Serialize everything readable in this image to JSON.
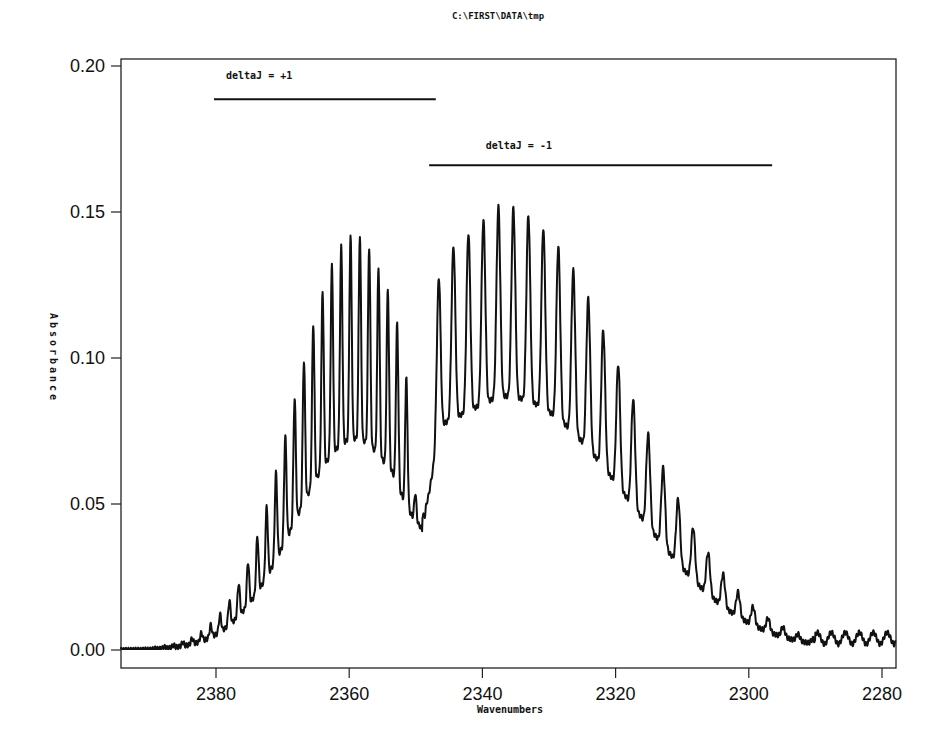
{
  "title": "C:\\FIRST\\DATA\\tmp",
  "chart_data": {
    "type": "line",
    "title": "C:\\FIRST\\DATA\\tmp",
    "xlabel": "Wavenumbers",
    "ylabel": "Absorbance",
    "xlim": [
      2394.3,
      2277.9
    ],
    "x_reversed": true,
    "ylim": [
      -0.006,
      0.202
    ],
    "x_ticks": [
      2380,
      2360,
      2340,
      2320,
      2300,
      2280
    ],
    "x_tick_labels": [
      "2380",
      "2360",
      "2340",
      "2320",
      "2300",
      "2280"
    ],
    "y_ticks": [
      0.0,
      0.05,
      0.1,
      0.15,
      0.2
    ],
    "y_tick_labels": [
      "0.00",
      "0.05",
      "0.10",
      "0.15",
      "0.20"
    ],
    "grid": false,
    "legend": null,
    "annotations": [
      {
        "text": "deltaJ = +1",
        "line_x": [
          2380.3,
          2347.0
        ],
        "line_y": 0.1886,
        "text_x": 2378.5,
        "text_y": 0.1955
      },
      {
        "text": "deltaJ = -1",
        "line_x": [
          2348.0,
          2296.5
        ],
        "line_y": 0.166,
        "text_x": 2339.5,
        "text_y": 0.1715
      }
    ],
    "series": [
      {
        "name": "Absorbance spectrum",
        "color": "#111111",
        "description": "Rotational-vibrational band with R branch (deltaJ=+1, ~2394-2349 cm-1) and P branch (deltaJ=-1, ~2349-2278 cm-1); band gap near 2349 cm-1",
        "r_branch_peaks": {
          "x": [
            2385.0,
            2383.6,
            2382.2,
            2380.8,
            2379.4,
            2378.0,
            2376.6,
            2375.2,
            2373.8,
            2372.4,
            2371.0,
            2369.6,
            2368.2,
            2366.8,
            2365.4,
            2364.0,
            2362.6,
            2361.2,
            2359.8,
            2358.4,
            2357.0,
            2355.6,
            2354.2,
            2352.8,
            2351.4
          ],
          "y": [
            0.006,
            0.009,
            0.013,
            0.019,
            0.026,
            0.034,
            0.043,
            0.054,
            0.066,
            0.079,
            0.093,
            0.107,
            0.121,
            0.134,
            0.147,
            0.159,
            0.168,
            0.176,
            0.181,
            0.189,
            0.183,
            0.178,
            0.168,
            0.15,
            0.108
          ]
        },
        "p_branch_peaks": {
          "x": [
            2346.6,
            2344.3,
            2342.1,
            2339.8,
            2337.6,
            2335.3,
            2333.1,
            2330.8,
            2328.6,
            2326.3,
            2324.1,
            2321.8,
            2319.6,
            2317.3,
            2315.1,
            2312.8,
            2310.6,
            2308.3,
            2306.1,
            2303.8,
            2301.6,
            2299.3,
            2297.1,
            2294.8,
            2292.6,
            2290.3,
            2288.1,
            2285.8
          ],
          "y": [
            0.079,
            0.146,
            0.15,
            0.152,
            0.154,
            0.15,
            0.149,
            0.146,
            0.143,
            0.142,
            0.13,
            0.125,
            0.119,
            0.112,
            0.101,
            0.088,
            0.073,
            0.06,
            0.051,
            0.041,
            0.031,
            0.024,
            0.018,
            0.014,
            0.011,
            0.009,
            0.007,
            0.006
          ]
        },
        "baseline": 0.0,
        "band_center_min": {
          "x": 2348.6,
          "y": 0.046
        }
      }
    ],
    "synthesis": {
      "r_env_peak_x": 2359.0,
      "r_env_peak_y": 0.155,
      "r_env_width": 12.5,
      "p_env_peak_x": 2337.5,
      "p_env_peak_y": 0.118,
      "p_env_width": 18.0,
      "r_spacing": 1.4,
      "p_spacing": 2.25,
      "modulation": 0.42
    }
  },
  "axes": {
    "x_label": "Wavenumbers",
    "y_label": "Absorbance"
  }
}
